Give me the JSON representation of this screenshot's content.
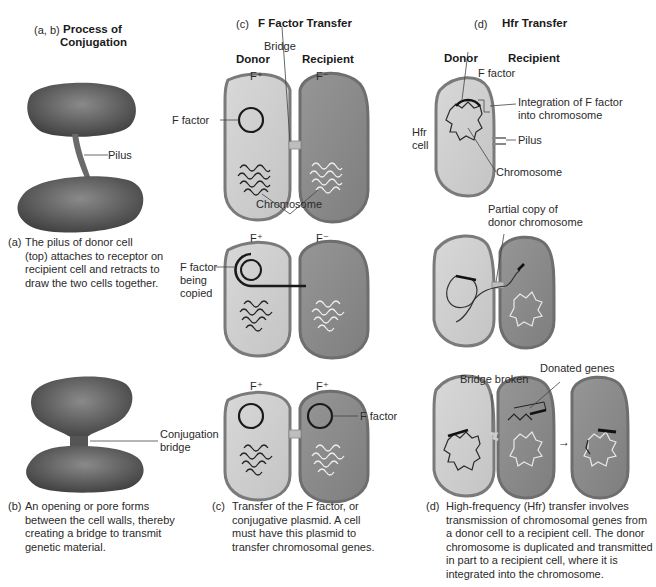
{
  "panels": {
    "ab": {
      "label": "(a, b)",
      "title_line1": "Process of",
      "title_line2": "Conjugation",
      "pilus_label": "Pilus",
      "conj_bridge_line1": "Conjugation",
      "conj_bridge_line2": "bridge",
      "caption_a_label": "(a)",
      "caption_a": "The pilus of donor cell\n(top) attaches to receptor on\nrecipient cell and retracts to\ndraw the two cells together.",
      "caption_b_label": "(b)",
      "caption_b": "An opening or pore forms\nbetween the cell walls, thereby\ncreating a bridge to transmit\ngenetic material."
    },
    "c": {
      "label": "(c)",
      "title": "F Factor Transfer",
      "bridge_label": "Bridge",
      "donor_label": "Donor",
      "recipient_label": "Recipient",
      "row1": {
        "donor_type": "F⁺",
        "recipient_type": "F⁻",
        "f_factor_label": "F factor",
        "chromosome_label": "Chromosome"
      },
      "row2": {
        "donor_type": "F⁺",
        "recipient_type": "F⁻",
        "f_factor_line1": "F factor",
        "f_factor_line2": "being",
        "f_factor_line3": "copied"
      },
      "row3": {
        "donor_type": "F⁺",
        "recipient_type": "F⁺",
        "f_factor_label": "F factor"
      },
      "caption_label": "(c)",
      "caption": "Transfer of the F factor, or\nconjugative plasmid. A cell\nmust have this plasmid to\ntransfer chromosomal genes."
    },
    "d": {
      "label": "(d)",
      "title": "Hfr Transfer",
      "donor_label": "Donor",
      "recipient_label": "Recipient",
      "f_factor_label": "F factor",
      "integration_line1": "Integration of F factor",
      "integration_line2": "into chromosome",
      "hfr_cell_line1": "Hfr",
      "hfr_cell_line2": "cell",
      "pilus_label": "Pilus",
      "chromosome_label": "Chromosome",
      "partial_copy_line1": "Partial copy of",
      "partial_copy_line2": "donor chromosome",
      "bridge_broken_label": "Bridge broken",
      "donated_genes_label": "Donated genes",
      "arrow_symbol": "→",
      "caption_label": "(d)",
      "caption": "High-frequency (Hfr) transfer involves\ntransmission of chromosomal genes from\na donor cell to a recipient cell. The donor\nchromosome is duplicated and transmitted\nin part to a recipient cell, where it is\nintegrated into the chromosome."
    }
  },
  "colors": {
    "donor_fill": "#cfcfcf",
    "recipient_fill": "#8c8c8c",
    "cell_outline": "#7a7a7a",
    "blob_dark": "#5a5a5a"
  }
}
